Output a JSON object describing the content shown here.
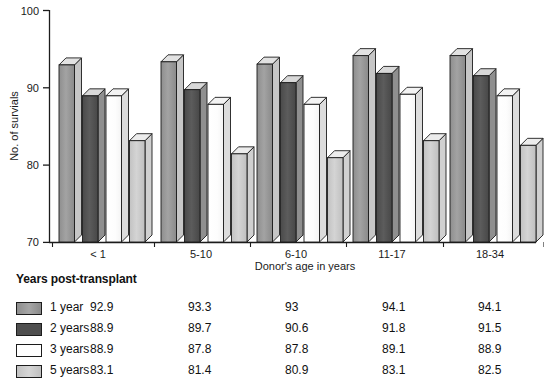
{
  "chart_data": {
    "type": "bar",
    "title": "",
    "xlabel": "Donor's age in years",
    "ylabel": "No. of survials",
    "categories": [
      "< 1",
      "5-10",
      "6-10",
      "11-17",
      "18-34"
    ],
    "series": [
      {
        "name": "1 year",
        "values": [
          92.9,
          93.3,
          93.0,
          94.1,
          94.1
        ],
        "color": "#9a9a9a"
      },
      {
        "name": "2 years",
        "values": [
          88.9,
          89.7,
          90.6,
          91.8,
          91.5
        ],
        "color": "#555555"
      },
      {
        "name": "3 years",
        "values": [
          88.9,
          87.8,
          87.8,
          89.1,
          88.9
        ],
        "color": "#ffffff"
      },
      {
        "name": "5 years",
        "values": [
          83.1,
          81.4,
          80.9,
          83.1,
          82.5
        ],
        "color": "#cacaca"
      }
    ],
    "ylim": [
      70,
      100
    ],
    "yticks": [
      70,
      80,
      90,
      100
    ],
    "ytick_labels": [
      "70",
      "80",
      "90",
      "100"
    ],
    "grid": false,
    "legend_position": "below-table",
    "value_labels": {
      "1 year": [
        "92.9",
        "93.3",
        "93",
        "94.1",
        "94.1"
      ],
      "2 years": [
        "88.9",
        "89.7",
        "90.6",
        "91.8",
        "91.5"
      ],
      "3 years": [
        "88.9",
        "87.8",
        "87.8",
        "89.1",
        "88.9"
      ],
      "5 years": [
        "83.1",
        "81.4",
        "80.9",
        "83.1",
        "82.5"
      ]
    }
  },
  "axes": {
    "y_label": "No. of survials",
    "x_label": "Donor's age in years",
    "y_ticks": [
      "100",
      "90",
      "80",
      "70"
    ],
    "x_groups": [
      "< 1",
      "5-10",
      "6-10",
      "11-17",
      "18-34"
    ]
  },
  "legend": {
    "heading": "Years post-transplant",
    "rows": [
      {
        "label": "1 year",
        "values": [
          "92.9",
          "93.3",
          "93",
          "94.1",
          "94.1"
        ]
      },
      {
        "label": "2 years",
        "values": [
          "88.9",
          "89.7",
          "90.6",
          "91.8",
          "91.5"
        ]
      },
      {
        "label": "3 years",
        "values": [
          "88.9",
          "87.8",
          "87.8",
          "89.1",
          "88.9"
        ]
      },
      {
        "label": "5 years",
        "values": [
          "83.1",
          "81.4",
          "80.9",
          "83.1",
          "82.5"
        ]
      }
    ]
  },
  "colors": {
    "series_1_year": "#9a9a9a",
    "series_2_years": "#555555",
    "series_3_years": "#ffffff",
    "series_5_years": "#cacaca",
    "axis": "#1c1c1c",
    "background": "#ffffff"
  }
}
